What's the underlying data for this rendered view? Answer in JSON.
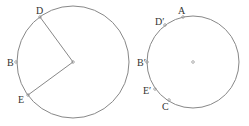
{
  "diagram": {
    "left_circle": {
      "center": [
        73,
        62
      ],
      "radius": 56,
      "points": [
        {
          "id": "D",
          "label": "D",
          "x": 40,
          "y": 17,
          "lx": 36,
          "ly": 14
        },
        {
          "id": "B",
          "label": "B",
          "x": 16,
          "y": 62,
          "lx": 7,
          "ly": 66
        },
        {
          "id": "E",
          "label": "E",
          "x": 28,
          "y": 95,
          "lx": 18,
          "ly": 103
        }
      ]
    },
    "right_circle": {
      "center": [
        193,
        62
      ],
      "radius": 46,
      "points": [
        {
          "id": "A",
          "label": "A",
          "x": 183,
          "y": 17,
          "lx": 178,
          "ly": 14
        },
        {
          "id": "Dp",
          "label": "D′",
          "x": 165,
          "y": 25,
          "lx": 155,
          "ly": 25
        },
        {
          "id": "Bp",
          "label": "B′",
          "x": 147,
          "y": 62,
          "lx": 137,
          "ly": 66
        },
        {
          "id": "Ep",
          "label": "E′",
          "x": 155,
          "y": 89,
          "lx": 143,
          "ly": 94
        },
        {
          "id": "C",
          "label": "C",
          "x": 169,
          "y": 100,
          "lx": 162,
          "ly": 110
        }
      ]
    },
    "colors": {
      "stroke": "#888888",
      "point": "#999999"
    }
  }
}
